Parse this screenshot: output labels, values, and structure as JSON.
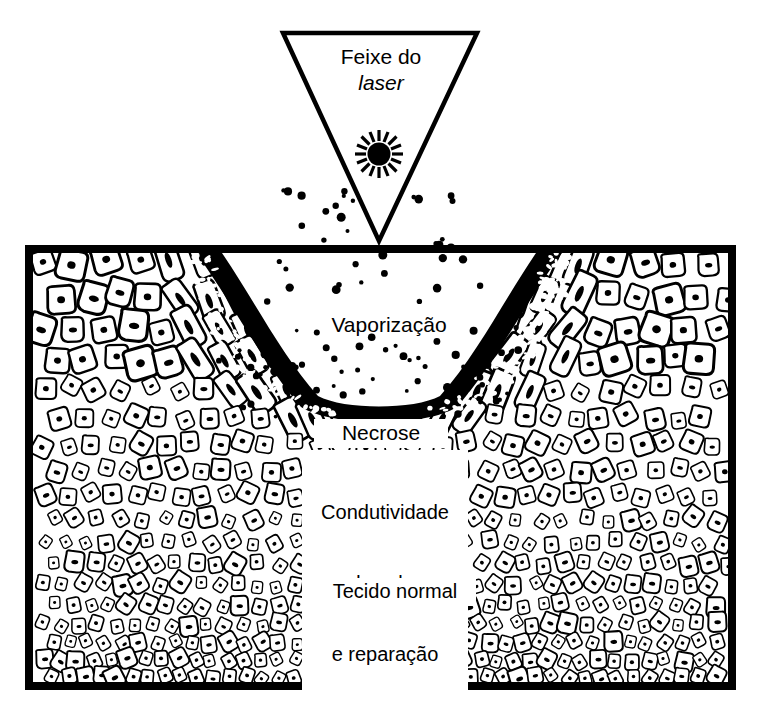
{
  "figure": {
    "title_text": "",
    "language": "pt-BR"
  },
  "beam": {
    "label_line1": "Feixe do",
    "label_line2": "laser",
    "source_icon": "laser-burst-icon",
    "shape": "inverted-triangle"
  },
  "labels": {
    "vaporization": "Vaporização",
    "necrosis": "Necrose",
    "conduction_line1": "Condutividade",
    "conduction_line2": "do calor",
    "conduction_line3": "e reparação",
    "normal_tissue": "Tecido normal"
  },
  "colors": {
    "ink": "#000000",
    "paper": "#ffffff",
    "necrosis_band": "#000000",
    "tissue_outline": "#000000"
  },
  "geometry": {
    "canvas_width": 758,
    "canvas_height": 715,
    "triangle_top_left_x": 283,
    "triangle_top_right_x": 477,
    "triangle_top_y": 33,
    "triangle_apex_x": 379,
    "triangle_apex_y": 241,
    "tissue_block_left": 25,
    "tissue_block_top": 245,
    "tissue_block_right": 736,
    "tissue_block_bottom": 690,
    "crater_center_x": 379,
    "crater_floor_y": 420,
    "crater_mouth_left_x": 196,
    "crater_mouth_right_x": 562
  },
  "vapor_particles": {
    "count_approx": 70,
    "note": "pontos dispersos entre o apice do feixe e o fundo da cratera"
  }
}
